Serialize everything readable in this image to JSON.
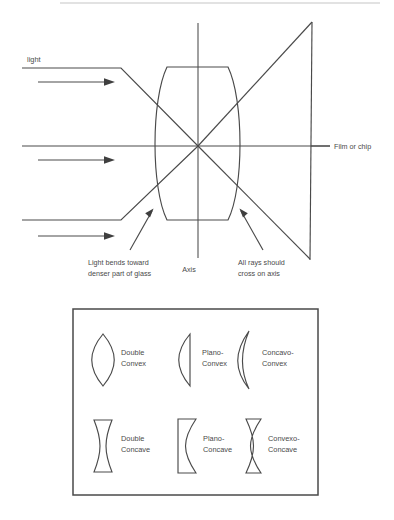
{
  "figure": {
    "background": "#ffffff",
    "ink_color": "#4a4a4a",
    "top_rule_color": "#e2e2e2"
  },
  "ray_diagram": {
    "labels": {
      "light": "light",
      "film_or_chip": "Film or chip",
      "axis": "Axis",
      "bend_note_line1": "Light bends toward",
      "bend_note_line2": "denser part of glass",
      "cross_note_line1": "All rays should",
      "cross_note_line2": "cross on axis"
    },
    "elements": {
      "lens_name": "biconvex-lens",
      "axis_name": "optical-axis",
      "film_name": "film-plane",
      "incoming_ray_count": 3,
      "direction_arrow_count": 3
    }
  },
  "lens_types_panel": {
    "rows": [
      {
        "lenses": [
          {
            "shape": "double-convex",
            "label_line1": "Double",
            "label_line2": "Convex"
          },
          {
            "shape": "plano-convex",
            "label_line1": "Plano-",
            "label_line2": "Convex"
          },
          {
            "shape": "concavo-convex",
            "label_line1": "Concavo-",
            "label_line2": "Convex"
          }
        ]
      },
      {
        "lenses": [
          {
            "shape": "double-concave",
            "label_line1": "Double",
            "label_line2": "Concave"
          },
          {
            "shape": "plano-concave",
            "label_line1": "Plano-",
            "label_line2": "Concave"
          },
          {
            "shape": "convexo-concave",
            "label_line1": "Convexo-",
            "label_line2": "Concave"
          }
        ]
      }
    ]
  }
}
